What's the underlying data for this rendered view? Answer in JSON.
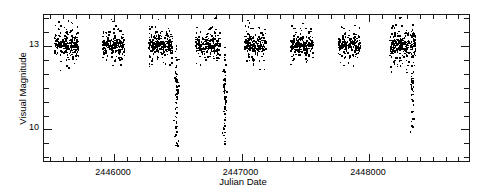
{
  "chart_data": {
    "type": "scatter",
    "title": "",
    "xlabel": "Julian Date",
    "ylabel": "Visual Magnitude",
    "xlim": [
      2445450,
      2448800
    ],
    "ylim": [
      14.1,
      8.8
    ],
    "y_inverted": true,
    "grid": false,
    "legend": null,
    "xticks_major": [
      2446000,
      2447000,
      2448000
    ],
    "xticklabels": [
      "2446000",
      "2447000",
      "2448000"
    ],
    "xtick_minor_step": 100,
    "yticks_major": [
      10,
      13
    ],
    "yticklabels": [
      "10",
      "13"
    ],
    "ytick_minor_step": 0.5,
    "marker": "point",
    "marker_color": "#000000",
    "seasons": [
      {
        "center_jd": 2445620,
        "n": 240,
        "quiescent_mag": 13.05,
        "spread_mag": 0.38,
        "half_width_jd": 95
      },
      {
        "center_jd": 2445990,
        "n": 215,
        "quiescent_mag": 13.05,
        "spread_mag": 0.34,
        "half_width_jd": 85
      },
      {
        "center_jd": 2446360,
        "n": 230,
        "quiescent_mag": 13.05,
        "spread_mag": 0.38,
        "half_width_jd": 95
      },
      {
        "center_jd": 2446730,
        "n": 235,
        "quiescent_mag": 13.05,
        "spread_mag": 0.38,
        "half_width_jd": 95
      },
      {
        "center_jd": 2447100,
        "n": 205,
        "quiescent_mag": 13.05,
        "spread_mag": 0.36,
        "half_width_jd": 85
      },
      {
        "center_jd": 2447470,
        "n": 215,
        "quiescent_mag": 13.05,
        "spread_mag": 0.36,
        "half_width_jd": 90
      },
      {
        "center_jd": 2447840,
        "n": 190,
        "quiescent_mag": 13.05,
        "spread_mag": 0.32,
        "half_width_jd": 88
      },
      {
        "center_jd": 2448260,
        "n": 260,
        "quiescent_mag": 13.05,
        "spread_mag": 0.42,
        "half_width_jd": 100
      }
    ],
    "outbursts": [
      {
        "jd": 2446485,
        "peak_mag": 9.45,
        "n": 46
      },
      {
        "jd": 2446860,
        "peak_mag": 9.55,
        "n": 42
      },
      {
        "jd": 2448335,
        "peak_mag": 10.05,
        "n": 30
      }
    ]
  }
}
